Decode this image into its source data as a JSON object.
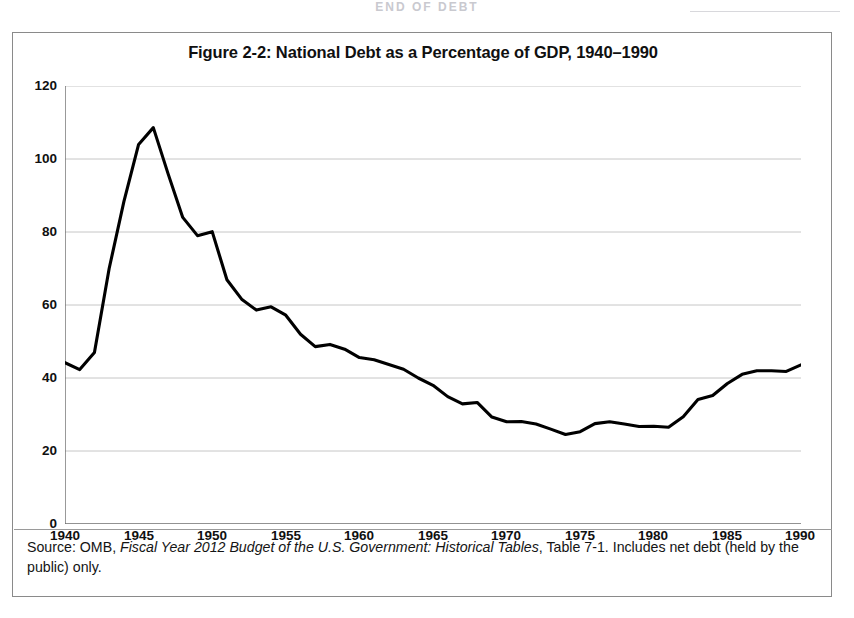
{
  "page": {
    "running_head": "END OF DEBT"
  },
  "figure": {
    "title": "Figure 2-2: National Debt as a Percentage of GDP, 1940–1990",
    "source_prefix": "Source: OMB, ",
    "source_italic": "Fiscal Year 2012 Budget of the U.S. Government: Historical Tables",
    "source_suffix": ", Table 7-1. Includes net debt (held by the public) only."
  },
  "axes": {
    "y_ticks": [
      "0",
      "20",
      "40",
      "60",
      "80",
      "100",
      "120"
    ],
    "x_ticks": [
      "1940",
      "1945",
      "1950",
      "1955",
      "1960",
      "1965",
      "1970",
      "1975",
      "1980",
      "1985",
      "1990"
    ]
  },
  "chart_data": {
    "type": "line",
    "title": "Figure 2-2: National Debt as a Percentage of GDP, 1940–1990",
    "xlabel": "",
    "ylabel": "",
    "xlim": [
      1940,
      1990
    ],
    "ylim": [
      0,
      120
    ],
    "y_ticks": [
      0,
      20,
      40,
      60,
      80,
      100,
      120
    ],
    "x_ticks": [
      1940,
      1945,
      1950,
      1955,
      1960,
      1965,
      1970,
      1975,
      1980,
      1985,
      1990
    ],
    "grid": "horizontal",
    "legend": "none",
    "line_color": "#000000",
    "series": [
      {
        "name": "National debt (net, held by the public) as % of GDP",
        "x": [
          1940,
          1941,
          1942,
          1943,
          1944,
          1945,
          1946,
          1947,
          1948,
          1949,
          1950,
          1951,
          1952,
          1953,
          1954,
          1955,
          1956,
          1957,
          1958,
          1959,
          1960,
          1961,
          1962,
          1963,
          1964,
          1965,
          1966,
          1967,
          1968,
          1969,
          1970,
          1971,
          1972,
          1973,
          1974,
          1975,
          1976,
          1977,
          1978,
          1979,
          1980,
          1981,
          1982,
          1983,
          1984,
          1985,
          1986,
          1987,
          1988,
          1989,
          1990
        ],
        "values": [
          44.2,
          42.3,
          47.0,
          70.0,
          88.3,
          104.0,
          108.6,
          96.0,
          84.0,
          79.0,
          80.1,
          66.9,
          61.6,
          58.6,
          59.5,
          57.2,
          52.0,
          48.6,
          49.2,
          47.9,
          45.6,
          45.0,
          43.7,
          42.4,
          40.0,
          38.0,
          34.9,
          32.9,
          33.3,
          29.3,
          28.0,
          28.1,
          27.4,
          26.0,
          24.5,
          25.3,
          27.5,
          28.0,
          27.4,
          26.7,
          26.8,
          26.5,
          29.4,
          34.1,
          35.2,
          38.5,
          41.0,
          42.0,
          42.0,
          41.8,
          43.6
        ]
      }
    ]
  }
}
